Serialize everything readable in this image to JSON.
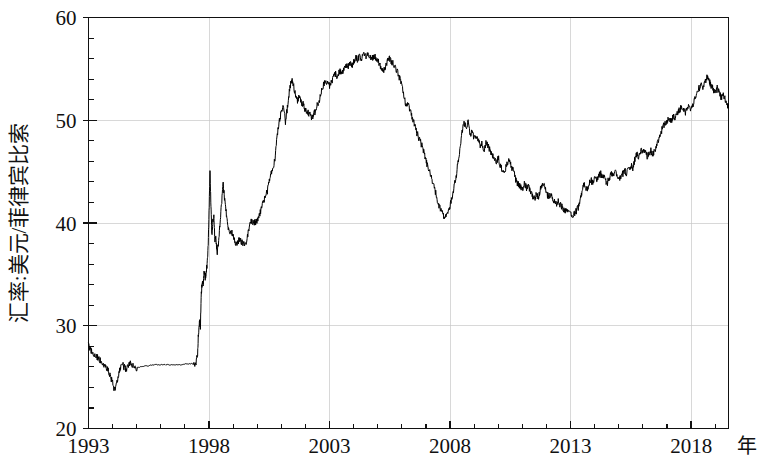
{
  "chart_data": {
    "type": "line",
    "title": "",
    "subtitle": "",
    "xlabel": "年",
    "ylabel": "汇率:美元/菲律宾比索",
    "xlim": [
      1993.0,
      2019.55
    ],
    "ylim": [
      20,
      60
    ],
    "grid": true,
    "grid_axes": "both",
    "legend": null,
    "legend_position": "none",
    "x_major_ticks": [
      1993,
      1998,
      2003,
      2008,
      2013,
      2018
    ],
    "x_major_tick_labels": [
      "1993",
      "1998",
      "2003",
      "2008",
      "2013",
      "2018"
    ],
    "x_minor_tick_step": 1,
    "y_major_ticks": [
      20,
      30,
      40,
      50,
      60
    ],
    "y_major_tick_labels": [
      "20",
      "30",
      "40",
      "50",
      "60"
    ],
    "y_minor_tick_step": 2,
    "x_unit_suffix": "年",
    "series": [
      {
        "name": "USD/PHP 汇率",
        "color": "#000000",
        "x": [
          1993.0,
          1993.08,
          1993.17,
          1993.25,
          1993.33,
          1993.42,
          1993.5,
          1993.58,
          1993.67,
          1993.75,
          1993.83,
          1993.92,
          1994.0,
          1994.08,
          1994.17,
          1994.25,
          1994.33,
          1994.42,
          1994.5,
          1994.58,
          1994.67,
          1994.75,
          1994.83,
          1994.92,
          1995.0,
          1995.17,
          1995.33,
          1995.5,
          1995.67,
          1995.83,
          1996.0,
          1996.17,
          1996.33,
          1996.5,
          1996.67,
          1996.83,
          1997.0,
          1997.17,
          1997.33,
          1997.45,
          1997.52,
          1997.56,
          1997.6,
          1997.64,
          1997.68,
          1997.72,
          1997.76,
          1997.8,
          1997.84,
          1997.88,
          1997.92,
          1997.96,
          1998.0,
          1998.04,
          1998.08,
          1998.12,
          1998.16,
          1998.2,
          1998.24,
          1998.28,
          1998.33,
          1998.4,
          1998.46,
          1998.52,
          1998.58,
          1998.64,
          1998.7,
          1998.76,
          1998.82,
          1998.88,
          1998.94,
          1999.0,
          1999.08,
          1999.17,
          1999.25,
          1999.33,
          1999.42,
          1999.5,
          1999.58,
          1999.67,
          1999.75,
          1999.83,
          1999.92,
          2000.0,
          2000.08,
          2000.17,
          2000.25,
          2000.33,
          2000.42,
          2000.5,
          2000.58,
          2000.67,
          2000.75,
          2000.83,
          2000.92,
          2001.0,
          2001.08,
          2001.17,
          2001.25,
          2001.33,
          2001.42,
          2001.5,
          2001.58,
          2001.67,
          2001.75,
          2001.83,
          2001.92,
          2002.0,
          2002.08,
          2002.17,
          2002.25,
          2002.33,
          2002.42,
          2002.5,
          2002.58,
          2002.67,
          2002.75,
          2002.83,
          2002.92,
          2003.0,
          2003.08,
          2003.17,
          2003.25,
          2003.33,
          2003.42,
          2003.5,
          2003.58,
          2003.67,
          2003.75,
          2003.83,
          2003.92,
          2004.0,
          2004.08,
          2004.17,
          2004.25,
          2004.33,
          2004.42,
          2004.5,
          2004.58,
          2004.67,
          2004.75,
          2004.83,
          2004.92,
          2005.0,
          2005.08,
          2005.17,
          2005.25,
          2005.33,
          2005.42,
          2005.5,
          2005.58,
          2005.67,
          2005.75,
          2005.83,
          2005.92,
          2006.0,
          2006.08,
          2006.17,
          2006.25,
          2006.33,
          2006.42,
          2006.5,
          2006.58,
          2006.67,
          2006.75,
          2006.83,
          2006.92,
          2007.0,
          2007.08,
          2007.17,
          2007.25,
          2007.33,
          2007.42,
          2007.5,
          2007.58,
          2007.67,
          2007.75,
          2007.83,
          2007.92,
          2008.0,
          2008.08,
          2008.17,
          2008.25,
          2008.33,
          2008.42,
          2008.5,
          2008.58,
          2008.67,
          2008.75,
          2008.83,
          2008.92,
          2009.0,
          2009.08,
          2009.17,
          2009.25,
          2009.33,
          2009.42,
          2009.5,
          2009.58,
          2009.67,
          2009.75,
          2009.83,
          2009.92,
          2010.0,
          2010.08,
          2010.17,
          2010.25,
          2010.33,
          2010.42,
          2010.5,
          2010.58,
          2010.67,
          2010.75,
          2010.83,
          2010.92,
          2011.0,
          2011.08,
          2011.17,
          2011.25,
          2011.33,
          2011.42,
          2011.5,
          2011.58,
          2011.67,
          2011.75,
          2011.83,
          2011.92,
          2012.0,
          2012.08,
          2012.17,
          2012.25,
          2012.33,
          2012.42,
          2012.5,
          2012.58,
          2012.67,
          2012.75,
          2012.83,
          2012.92,
          2013.0,
          2013.08,
          2013.17,
          2013.25,
          2013.33,
          2013.42,
          2013.5,
          2013.58,
          2013.67,
          2013.75,
          2013.83,
          2013.92,
          2014.0,
          2014.08,
          2014.17,
          2014.25,
          2014.33,
          2014.42,
          2014.5,
          2014.58,
          2014.67,
          2014.75,
          2014.83,
          2014.92,
          2015.0,
          2015.08,
          2015.17,
          2015.25,
          2015.33,
          2015.42,
          2015.5,
          2015.58,
          2015.67,
          2015.75,
          2015.83,
          2015.92,
          2016.0,
          2016.08,
          2016.17,
          2016.25,
          2016.33,
          2016.42,
          2016.5,
          2016.58,
          2016.67,
          2016.75,
          2016.83,
          2016.92,
          2017.0,
          2017.08,
          2017.17,
          2017.25,
          2017.33,
          2017.42,
          2017.5,
          2017.58,
          2017.67,
          2017.75,
          2017.83,
          2017.92,
          2018.0,
          2018.08,
          2018.17,
          2018.25,
          2018.33,
          2018.42,
          2018.5,
          2018.58,
          2018.67,
          2018.75,
          2018.83,
          2018.92,
          2019.0,
          2019.08,
          2019.17,
          2019.25,
          2019.35,
          2019.45,
          2019.55
        ],
        "y": [
          28.0,
          27.6,
          27.3,
          27.1,
          27.0,
          26.8,
          26.6,
          26.4,
          26.2,
          25.9,
          25.6,
          25.0,
          24.4,
          23.8,
          24.3,
          25.2,
          26.0,
          26.2,
          25.9,
          25.8,
          26.1,
          26.3,
          26.2,
          26.0,
          25.9,
          26.0,
          26.1,
          26.1,
          26.2,
          26.2,
          26.2,
          26.2,
          26.2,
          26.2,
          26.2,
          26.2,
          26.3,
          26.3,
          26.3,
          26.4,
          27.0,
          29.2,
          30.5,
          29.8,
          33.0,
          34.5,
          34.0,
          35.3,
          34.6,
          35.2,
          36.0,
          37.5,
          41.0,
          45.3,
          41.5,
          38.8,
          40.2,
          40.5,
          38.4,
          38.8,
          37.0,
          38.3,
          40.0,
          41.8,
          43.9,
          42.5,
          41.3,
          40.0,
          39.3,
          38.9,
          39.1,
          38.6,
          38.2,
          38.0,
          38.4,
          38.2,
          38.0,
          37.8,
          38.5,
          39.6,
          40.2,
          40.1,
          40.0,
          40.3,
          40.8,
          41.3,
          42.0,
          42.5,
          43.1,
          44.0,
          44.8,
          45.5,
          46.5,
          48.5,
          50.0,
          50.8,
          51.5,
          49.8,
          51.2,
          52.8,
          54.0,
          53.4,
          52.5,
          51.8,
          52.4,
          51.8,
          51.5,
          51.0,
          50.8,
          50.6,
          50.2,
          50.5,
          51.0,
          51.5,
          52.0,
          52.8,
          53.5,
          54.0,
          53.6,
          53.4,
          53.8,
          54.2,
          54.5,
          54.3,
          54.8,
          54.5,
          55.0,
          55.4,
          55.2,
          55.5,
          55.3,
          55.6,
          56.1,
          55.9,
          56.2,
          56.0,
          56.3,
          56.2,
          56.5,
          56.3,
          56.0,
          56.2,
          56.1,
          55.8,
          55.5,
          55.0,
          54.8,
          55.3,
          55.8,
          56.0,
          55.7,
          55.4,
          55.0,
          54.6,
          54.0,
          53.2,
          52.5,
          51.4,
          51.8,
          51.0,
          50.3,
          49.8,
          49.0,
          48.5,
          48.0,
          47.5,
          46.8,
          46.0,
          45.5,
          45.0,
          44.2,
          43.5,
          42.8,
          42.0,
          41.5,
          41.0,
          40.7,
          40.5,
          41.0,
          41.7,
          42.5,
          43.5,
          44.5,
          46.0,
          47.5,
          48.8,
          49.7,
          49.2,
          49.8,
          48.5,
          49.0,
          48.2,
          48.6,
          48.1,
          47.5,
          47.8,
          47.0,
          48.0,
          47.5,
          47.0,
          46.6,
          46.3,
          46.0,
          46.4,
          45.6,
          45.2,
          45.0,
          45.5,
          46.2,
          45.8,
          45.3,
          44.7,
          44.0,
          43.8,
          43.5,
          43.2,
          43.8,
          43.4,
          43.6,
          43.0,
          42.6,
          42.3,
          42.8,
          42.5,
          43.3,
          43.8,
          43.5,
          43.0,
          42.5,
          42.8,
          42.3,
          42.0,
          41.8,
          42.2,
          41.7,
          41.5,
          41.3,
          41.1,
          41.0,
          40.8,
          40.7,
          40.9,
          41.2,
          41.6,
          42.5,
          43.4,
          43.8,
          43.3,
          43.6,
          44.2,
          43.9,
          44.5,
          44.2,
          44.6,
          44.8,
          44.5,
          44.3,
          43.8,
          44.2,
          44.8,
          44.6,
          45.0,
          44.7,
          44.2,
          44.5,
          44.8,
          45.1,
          44.8,
          45.3,
          45.6,
          45.4,
          46.2,
          46.8,
          46.4,
          47.0,
          47.2,
          46.9,
          46.5,
          46.8,
          47.0,
          46.7,
          47.0,
          47.5,
          48.2,
          48.8,
          49.4,
          49.6,
          49.9,
          50.2,
          49.9,
          50.4,
          50.2,
          50.6,
          50.9,
          51.3,
          51.0,
          50.7,
          51.2,
          51.5,
          51.0,
          51.6,
          52.2,
          52.5,
          53.1,
          53.4,
          53.2,
          53.8,
          54.3,
          53.8,
          53.3,
          53.0,
          52.7,
          53.2,
          52.6,
          52.2,
          52.4,
          51.8,
          51.2
        ]
      }
    ],
    "noise_amplitude": 0.33,
    "noise_seed": 20190731
  },
  "axis": {
    "y_title": "汇率:美元/菲律宾比索",
    "x_unit": "年"
  }
}
